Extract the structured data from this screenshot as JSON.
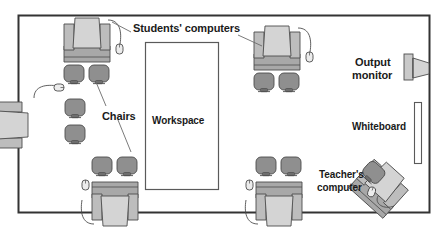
{
  "diagram": {
    "room_frame": {
      "name": "classroom-boundary",
      "x": 18,
      "y": 15,
      "width": 412,
      "height": 198
    },
    "colors": {
      "outline": "#4d4d4d",
      "frame": "#333333",
      "monitor_light": "#d4d4d4",
      "monitor_mid": "#bdbdbd",
      "desk_dark": "#a8a8a8",
      "chair": "#8f8f8f",
      "chair_dark": "#6e6e6e",
      "device_light": "#e6e6e6",
      "text": "#1a1a1a",
      "leader": "#6b6b6b",
      "workspace_fill": "#ffffff"
    },
    "labels": [
      {
        "name": "label-students-computers",
        "text": "Students' computers",
        "x": 133,
        "y": 22,
        "size": 11
      },
      {
        "name": "label-chairs",
        "text": "Chairs",
        "x": 102,
        "y": 110,
        "size": 11
      },
      {
        "name": "label-workspace",
        "text": "Workspace",
        "x": 152,
        "y": 115,
        "size": 10
      },
      {
        "name": "label-output-monitor-line1",
        "text": "Output",
        "x": 355,
        "y": 56,
        "size": 11
      },
      {
        "name": "label-output-monitor-line2",
        "text": "monitor",
        "x": 352,
        "y": 69,
        "size": 11
      },
      {
        "name": "label-whiteboard",
        "text": "Whiteboard",
        "x": 352,
        "y": 121,
        "size": 10
      },
      {
        "name": "label-teachers-computer-line1",
        "text": "Teacher's",
        "x": 319,
        "y": 169,
        "size": 10
      },
      {
        "name": "label-teachers-computer-line2",
        "text": "computer",
        "x": 317,
        "y": 182,
        "size": 10
      }
    ],
    "workspace": {
      "name": "workspace-area",
      "x": 145,
      "y": 42,
      "width": 74,
      "height": 148
    },
    "whiteboard": {
      "name": "whiteboard-panel",
      "x": 414,
      "y": 102,
      "width": 8,
      "height": 62
    },
    "output_monitor": {
      "name": "output-monitor-device",
      "x": 404,
      "y": 54
    },
    "student_stations": [
      {
        "name": "student-station-top-left",
        "desk_x": 62,
        "desk_y": 16,
        "rotation": 0
      },
      {
        "name": "student-station-top-right",
        "desk_x": 252,
        "desk_y": 24,
        "rotation": 0
      },
      {
        "name": "student-station-left",
        "desk_x": 26,
        "desk_y": 100,
        "rotation": 270
      },
      {
        "name": "student-station-bottom-left",
        "desk_x": 90,
        "desk_y": 178,
        "rotation": 180
      },
      {
        "name": "student-station-bottom-right",
        "desk_x": 254,
        "desk_y": 178,
        "rotation": 180
      }
    ],
    "teacher_station": {
      "name": "teacher-station",
      "x": 372,
      "y": 158,
      "rotation": 42
    },
    "chair_count": 10,
    "computer_count": 6
  }
}
